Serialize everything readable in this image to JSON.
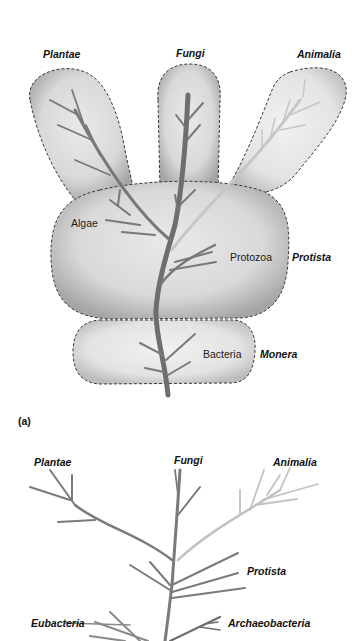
{
  "panel_a": {
    "panel_label": "(a)",
    "kingdoms": {
      "plantae": "Plantae",
      "fungi": "Fungi",
      "animalia": "Animalia",
      "protista": "Protista",
      "monera": "Monera"
    },
    "groups": {
      "algae": "Algae",
      "protozoa": "Protozoa",
      "bacteria": "Bacteria"
    }
  },
  "panel_b": {
    "kingdoms": {
      "plantae": "Plantae",
      "fungi": "Fungi",
      "animalia": "Animalia",
      "protista": "Protista",
      "eubacteria": "Eubacteria",
      "archaeobacteria": "Archaeobacteria"
    }
  },
  "colors": {
    "background": "#ffffff",
    "blob_fill_light": "#e6e6e6",
    "blob_fill_dark": "#a8a8a8",
    "trunk": "#6e6e6e",
    "branch_plant": "#7a7a7a",
    "branch_animal": "#c4c4c4",
    "dash_outline": "#3a3a3a"
  }
}
